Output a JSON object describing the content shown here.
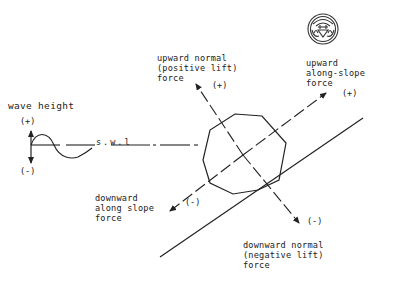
{
  "diagram": {
    "wave": {
      "title": "wave height",
      "plus": "(+)",
      "minus": "(-)",
      "swl_label": "s.w.l"
    },
    "normal_axis": {
      "upward_label_lines": [
        "upward normal",
        "(positive lift)",
        "force"
      ],
      "upward_sign": "(+)",
      "downward_label_lines": [
        "downward normal",
        "(negative lift)",
        "force"
      ],
      "downward_sign": "(-)"
    },
    "slope_axis": {
      "upward_label_lines": [
        "upward",
        "along-slope",
        "force"
      ],
      "upward_sign": "(+)",
      "downward_label_lines": [
        "downward",
        "along slope",
        "force"
      ],
      "downward_sign": "(-)"
    },
    "shapes": {
      "body": "octagon",
      "seabed": "sloping-line",
      "logo": "circular-emblem"
    },
    "colors": {
      "ink": "#222222",
      "background": "#ffffff"
    }
  }
}
